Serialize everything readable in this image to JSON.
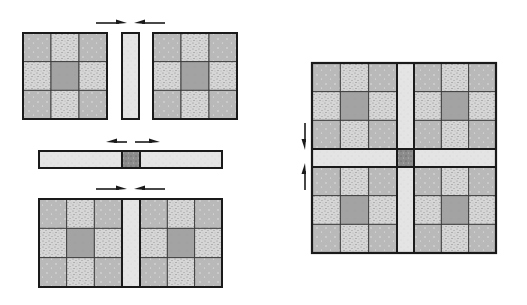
{
  "diagram": {
    "colors": {
      "background": "#ffffff",
      "outline": "#1a1a1a",
      "solid_cell": "#b9b9b9",
      "stipple_cell": "#d6d6d6",
      "center_cell": "#a3a3a3",
      "sashing": "#e4e4e4",
      "cornerstone": "#8c8c8c",
      "arrow": "#1a1a1a"
    },
    "left_panel": {
      "step1": {
        "blocks": [
          {
            "name": "nine-patch-block-top-left",
            "x": 23,
            "y": 33,
            "w": 84,
            "h": 86
          },
          {
            "name": "nine-patch-block-top-right",
            "x": 153,
            "y": 33,
            "w": 84,
            "h": 86
          }
        ],
        "sashing": {
          "x": 122,
          "y": 33,
          "w": 17,
          "h": 86
        },
        "arrows": [
          {
            "direction": "right",
            "x1": 96,
            "x2": 127,
            "y": 23
          },
          {
            "direction": "left",
            "x1": 165,
            "x2": 134,
            "y": 23
          }
        ]
      },
      "step2": {
        "sashing_row": {
          "x": 39,
          "y": 151,
          "w": 183,
          "h": 17
        },
        "cornerstone": {
          "x": 122,
          "y": 151,
          "w": 18,
          "h": 17
        },
        "arrows": [
          {
            "direction": "left",
            "x1": 127,
            "x2": 106,
            "y": 142
          },
          {
            "direction": "right",
            "x1": 135,
            "x2": 160,
            "y": 142
          }
        ]
      },
      "step3": {
        "row": {
          "x": 39,
          "y": 199,
          "w": 183,
          "h": 88
        },
        "blocks": [
          {
            "name": "nine-patch-block-bottom-left",
            "x": 39,
            "y": 199,
            "w": 83,
            "h": 88
          },
          {
            "name": "nine-patch-block-bottom-right",
            "x": 140,
            "y": 199,
            "w": 82,
            "h": 88
          }
        ],
        "sashing": {
          "x": 122,
          "y": 199,
          "w": 18,
          "h": 88
        },
        "arrows": [
          {
            "direction": "right",
            "x1": 96,
            "x2": 127,
            "y": 189
          },
          {
            "direction": "left",
            "x1": 165,
            "x2": 134,
            "y": 189
          }
        ]
      }
    },
    "right_panel": {
      "assembled": {
        "x": 312,
        "y": 63,
        "w": 184,
        "h": 190
      },
      "blocks": [
        {
          "name": "nine-patch-block-q1",
          "x": 312,
          "y": 63,
          "w": 85,
          "h": 86
        },
        {
          "name": "nine-patch-block-q2",
          "x": 414,
          "y": 63,
          "w": 82,
          "h": 86
        },
        {
          "name": "nine-patch-block-q3",
          "x": 312,
          "y": 167,
          "w": 85,
          "h": 86
        },
        {
          "name": "nine-patch-block-q4",
          "x": 414,
          "y": 167,
          "w": 82,
          "h": 86
        }
      ],
      "sashing_vertical": {
        "x": 397,
        "y": 63,
        "w": 17,
        "h": 190
      },
      "sashing_horizontal": {
        "x": 312,
        "y": 149,
        "w": 184,
        "h": 18
      },
      "cornerstone": {
        "x": 397,
        "y": 149,
        "w": 17,
        "h": 18
      },
      "arrows": [
        {
          "direction": "down",
          "x": 305,
          "y1": 123,
          "y2": 150
        },
        {
          "direction": "up",
          "x": 305,
          "y1": 190,
          "y2": 163
        }
      ]
    },
    "nine_patch_pattern": [
      [
        "solid",
        "stipple",
        "solid"
      ],
      [
        "stipple",
        "center",
        "stipple"
      ],
      [
        "solid",
        "stipple",
        "solid"
      ]
    ]
  }
}
